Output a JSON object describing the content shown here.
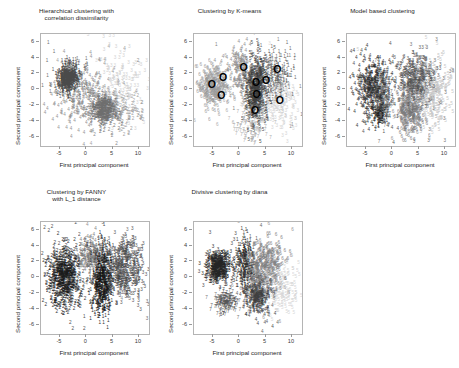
{
  "figure": {
    "width": 459,
    "height": 368,
    "background": "#ffffff",
    "frame_color": "#b4b4b4",
    "text_color": "#1c1c1c"
  },
  "axes": {
    "xlabel": "First principal component",
    "ylabel": "Second principal component",
    "xticks": [
      "-5",
      "0",
      "5",
      "10"
    ],
    "xtick_values": [
      -5,
      0,
      5,
      10
    ],
    "yticks": [
      "6",
      "4",
      "2",
      "0",
      "-2",
      "-4",
      "-6"
    ],
    "ytick_values": [
      6,
      4,
      2,
      0,
      -2,
      -4,
      -6
    ],
    "xlim": [
      -8.6,
      11.9
    ],
    "ylim": [
      -7.2,
      7.0
    ]
  },
  "chart_data": {
    "type": "scatter",
    "xlabel": "First principal component",
    "ylabel": "Second principal component",
    "xlim": [
      -8.6,
      11.9
    ],
    "ylim": [
      -7.2,
      7.0
    ],
    "grid": false,
    "legend": "none",
    "marker": "cluster-number-glyph",
    "panels": [
      {
        "id": "hierarchical",
        "title": "Hierarchical clustering with\ncorrelation dissimilarity",
        "row": 0,
        "col": 0,
        "seed": 1207,
        "n_points": 1450,
        "overlay": "none",
        "clusters": [
          {
            "label": "1",
            "color": "#4a4a4a",
            "weight": 0.4,
            "cx": -3.3,
            "cy": 1.2,
            "sx": 1.05,
            "sy": 0.85,
            "rot": 0.35,
            "size": 4.6
          },
          {
            "label": "2",
            "color": "#6e6e6e",
            "weight": 0.26,
            "cx": 3.3,
            "cy": -2.7,
            "sx": 1.15,
            "sy": 0.95,
            "rot": -0.2,
            "size": 4.6
          },
          {
            "label": "4",
            "color": "#8f8f8f",
            "weight": 0.18,
            "cx": -0.6,
            "cy": -1.2,
            "sx": 3.1,
            "sy": 2.3,
            "rot": 0.1,
            "size": 4.6
          },
          {
            "label": "3",
            "color": "#cfcfcf",
            "weight": 0.1,
            "cx": 6.6,
            "cy": 0.9,
            "sx": 2.6,
            "sy": 2.3,
            "rot": 0.0,
            "size": 4.6
          },
          {
            "label": "2",
            "color": "#9a9a9a",
            "weight": 0.06,
            "cx": 8.0,
            "cy": -3.2,
            "sx": 1.9,
            "sy": 1.0,
            "rot": 0.0,
            "size": 4.6
          }
        ]
      },
      {
        "id": "kmeans",
        "title": "Clustering by K-means",
        "row": 0,
        "col": 1,
        "seed": 4411,
        "n_points": 1500,
        "overlay": "centers",
        "centers_glyph": "O",
        "centers": [
          {
            "x": -5.2,
            "y": 0.2
          },
          {
            "x": -3.1,
            "y": 1.1
          },
          {
            "x": -3.4,
            "y": -1.3
          },
          {
            "x": 0.8,
            "y": 2.3
          },
          {
            "x": 3.2,
            "y": 0.4
          },
          {
            "x": 3.3,
            "y": -1.1
          },
          {
            "x": 3.0,
            "y": -3.2
          },
          {
            "x": 5.1,
            "y": 0.6
          },
          {
            "x": 7.2,
            "y": 2.1
          },
          {
            "x": 7.7,
            "y": -1.9
          }
        ],
        "clusters": [
          {
            "label": "6",
            "color": "#9a9a9a",
            "weight": 0.2,
            "cx": -5.0,
            "cy": 0.3,
            "sx": 1.35,
            "sy": 1.25,
            "rot": 0.0,
            "size": 4.6
          },
          {
            "label": "4",
            "color": "#8c8c8c",
            "weight": 0.12,
            "cx": 0.3,
            "cy": 2.1,
            "sx": 1.5,
            "sy": 1.5,
            "rot": 0.0,
            "size": 4.6
          },
          {
            "label": "5",
            "color": "#3c3c3c",
            "weight": 0.3,
            "cx": 3.2,
            "cy": -0.3,
            "sx": 0.95,
            "sy": 1.9,
            "rot": 0.0,
            "size": 4.6
          },
          {
            "label": "1",
            "color": "#5f5f5f",
            "weight": 0.16,
            "cx": 6.6,
            "cy": 1.5,
            "sx": 1.7,
            "sy": 1.5,
            "rot": 0.0,
            "size": 4.6
          },
          {
            "label": "7",
            "color": "#a8a8a8",
            "weight": 0.1,
            "cx": 2.4,
            "cy": -4.3,
            "sx": 1.6,
            "sy": 1.3,
            "rot": 0.0,
            "size": 4.6
          },
          {
            "label": "3",
            "color": "#d2d2d2",
            "weight": 0.12,
            "cx": 7.6,
            "cy": -2.0,
            "sx": 2.1,
            "sy": 1.6,
            "rot": 0.0,
            "size": 4.6
          }
        ]
      },
      {
        "id": "model-based",
        "title": "Model based clustering",
        "row": 0,
        "col": 2,
        "seed": 9102,
        "n_points": 1600,
        "overlay": "none",
        "clusters": [
          {
            "label": "4",
            "color": "#2e2e2e",
            "weight": 0.26,
            "cx": -3.6,
            "cy": 0.0,
            "sx": 1.5,
            "sy": 1.9,
            "rot": 0.0,
            "size": 4.6
          },
          {
            "label": "7",
            "color": "#6a6a6a",
            "weight": 0.1,
            "cx": -1.6,
            "cy": -1.4,
            "sx": 0.8,
            "sy": 1.7,
            "rot": 0.0,
            "size": 4.6
          },
          {
            "label": "3",
            "color": "#545454",
            "weight": 0.24,
            "cx": 4.6,
            "cy": 1.0,
            "sx": 1.7,
            "sy": 1.6,
            "rot": 0.0,
            "size": 4.6
          },
          {
            "label": "6",
            "color": "#7b7b7b",
            "weight": 0.18,
            "cx": 3.4,
            "cy": -2.9,
            "sx": 1.2,
            "sy": 1.5,
            "rot": 0.0,
            "size": 4.6
          },
          {
            "label": "5",
            "color": "#c4c4c4",
            "weight": 0.16,
            "cx": 7.6,
            "cy": -0.6,
            "sx": 1.8,
            "sy": 2.1,
            "rot": 0.0,
            "size": 4.6
          },
          {
            "label": "1",
            "color": "#1f1f1f",
            "weight": 0.06,
            "cx": -2.2,
            "cy": -3.3,
            "sx": 0.5,
            "sy": 0.9,
            "rot": 0.0,
            "size": 4.6
          }
        ]
      },
      {
        "id": "fanny",
        "title": "Clustering by FANNY\nwith L_1 distance",
        "row": 1,
        "col": 0,
        "seed": 3366,
        "n_points": 1750,
        "overlay": "none",
        "clusters": [
          {
            "label": "2",
            "color": "#1a1a1a",
            "weight": 0.34,
            "cx": -4.2,
            "cy": -0.2,
            "sx": 1.6,
            "sy": 1.9,
            "rot": 0.0,
            "size": 4.6
          },
          {
            "label": "1",
            "color": "#151515",
            "weight": 0.3,
            "cx": 3.0,
            "cy": -0.6,
            "sx": 0.95,
            "sy": 2.3,
            "rot": 0.0,
            "size": 4.6
          },
          {
            "label": "3",
            "color": "#4d4d4d",
            "weight": 0.26,
            "cx": 7.3,
            "cy": 0.8,
            "sx": 1.8,
            "sy": 1.8,
            "rot": 0.0,
            "size": 4.6
          },
          {
            "label": "4",
            "color": "#7a7a7a",
            "weight": 0.1,
            "cx": 0.6,
            "cy": 2.7,
            "sx": 1.3,
            "sy": 1.1,
            "rot": 0.0,
            "size": 4.6
          }
        ]
      },
      {
        "id": "diana",
        "title": "Divisive clustering by diana",
        "row": 1,
        "col": 1,
        "seed": 7788,
        "n_points": 1600,
        "overlay": "none",
        "clusters": [
          {
            "label": "3",
            "color": "#242424",
            "weight": 0.24,
            "cx": -3.9,
            "cy": 1.1,
            "sx": 1.2,
            "sy": 0.95,
            "rot": 0.0,
            "size": 4.6
          },
          {
            "label": "1",
            "color": "#2b2b2b",
            "weight": 0.14,
            "cx": 0.9,
            "cy": 1.6,
            "sx": 0.8,
            "sy": 1.6,
            "rot": 0.0,
            "size": 4.6
          },
          {
            "label": "6",
            "color": "#7e7e7e",
            "weight": 0.24,
            "cx": 4.9,
            "cy": 1.0,
            "sx": 1.8,
            "sy": 1.7,
            "rot": 0.0,
            "size": 4.6
          },
          {
            "label": "4",
            "color": "#3f3f3f",
            "weight": 0.18,
            "cx": 3.5,
            "cy": -2.6,
            "sx": 1.2,
            "sy": 1.2,
            "rot": 0.0,
            "size": 4.6
          },
          {
            "label": "7",
            "color": "#555555",
            "weight": 0.1,
            "cx": -2.6,
            "cy": -3.3,
            "sx": 1.1,
            "sy": 0.7,
            "rot": 0.0,
            "size": 4.6
          },
          {
            "label": "5",
            "color": "#d6d6d6",
            "weight": 0.1,
            "cx": 8.1,
            "cy": -1.6,
            "sx": 1.9,
            "sy": 1.9,
            "rot": 0.0,
            "size": 4.6
          }
        ]
      }
    ]
  },
  "layout": {
    "panel_width": 153,
    "panel_height_top": 180,
    "panel_height_bottom": 188,
    "plot_left": 40,
    "plot_top": 33,
    "plot_width": 108,
    "plot_height": 112
  }
}
